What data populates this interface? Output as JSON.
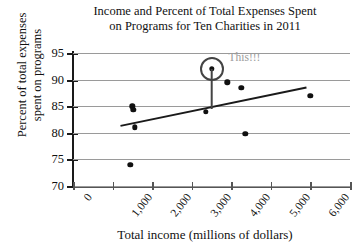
{
  "chart_data": {
    "type": "scatter",
    "title": "Income and Percent of Total Expenses Spent on Programs for Ten Charities in 2011",
    "title_lines": [
      "Income and Percent of Total Expenses Spent",
      "on Programs for Ten Charities in 2011"
    ],
    "xlabel": "Total income (millions of dollars)",
    "ylabel": "Percent of total expenses spent on programs",
    "ylabel_lines": [
      "Percent of total expenses",
      "spent on programs"
    ],
    "xlim": [
      0,
      7000
    ],
    "ylim": [
      70,
      95
    ],
    "xticks": [
      0,
      1000,
      2000,
      3000,
      4000,
      5000,
      6000,
      7000
    ],
    "xticklabels": [
      "0",
      "1,000",
      "2,000",
      "3,000",
      "4,000",
      "5,000",
      "6,000",
      "7,000"
    ],
    "yticks": [
      70,
      75,
      80,
      85,
      90,
      95
    ],
    "yticklabels": [
      "70",
      "75",
      "80",
      "85",
      "90",
      "95"
    ],
    "grid": "horizontal",
    "legend": "none",
    "points": [
      {
        "x": 1450,
        "y": 74.0
      },
      {
        "x": 1500,
        "y": 85.0
      },
      {
        "x": 1520,
        "y": 84.3
      },
      {
        "x": 1560,
        "y": 81.0
      },
      {
        "x": 3350,
        "y": 84.0
      },
      {
        "x": 3500,
        "y": 92.0
      },
      {
        "x": 3900,
        "y": 89.5
      },
      {
        "x": 4250,
        "y": 88.5
      },
      {
        "x": 4350,
        "y": 79.8
      },
      {
        "x": 6000,
        "y": 87.0
      }
    ],
    "trendline": {
      "x_start": 1200,
      "y_start": 81.3,
      "x_end": 5900,
      "y_end": 88.5
    },
    "highlight": {
      "point": {
        "x": 3500,
        "y": 92.0
      },
      "stem_bottom_y": 84.4,
      "annotation": "This!!!",
      "ring_color": "#444444",
      "annotation_color": "#9b9b9b"
    },
    "colors": {
      "point": "#111111",
      "grid": "#9a9a9a",
      "axis": "#1a1a1a",
      "trendline": "#1a1a1a",
      "background": "#ffffff"
    }
  }
}
